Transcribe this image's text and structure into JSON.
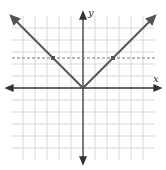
{
  "figure": {
    "type": "coordinate-graph",
    "axes": {
      "x_label": "x",
      "y_label": "y",
      "x_range": [
        -6.5,
        6.5
      ],
      "y_range": [
        -6.5,
        6.5
      ],
      "grid": true,
      "grid_step": 1,
      "arrows": true
    },
    "curves": [
      {
        "name": "absolute-value-function",
        "equation": "y = |x|",
        "style": "solid",
        "color": "#555555",
        "vertex": [
          0,
          0
        ]
      },
      {
        "name": "horizontal-line",
        "equation": "y = 2.5",
        "style": "dashed",
        "color": "#777777"
      }
    ],
    "points": [
      {
        "x": -2.5,
        "y": 2.5
      },
      {
        "x": 2.5,
        "y": 2.5
      }
    ],
    "colors": {
      "grid": "#d9d9d9",
      "axis": "#333333",
      "curve": "#555555",
      "dashed": "#777777"
    }
  }
}
